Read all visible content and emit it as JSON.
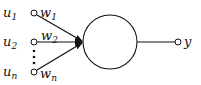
{
  "diagram": {
    "inputs": [
      {
        "label": "u",
        "sub": "1",
        "weight": "w",
        "weight_sub": "1"
      },
      {
        "label": "u",
        "sub": "2",
        "weight": "w",
        "weight_sub": "2"
      },
      {
        "label": "u",
        "sub": "n",
        "weight": "w",
        "weight_sub": "n"
      }
    ],
    "ellipsis": "⋮",
    "neuron": "summation-node",
    "output": {
      "label": "y"
    },
    "colors": {
      "stroke": "#111111",
      "background": "#ffffff"
    }
  }
}
